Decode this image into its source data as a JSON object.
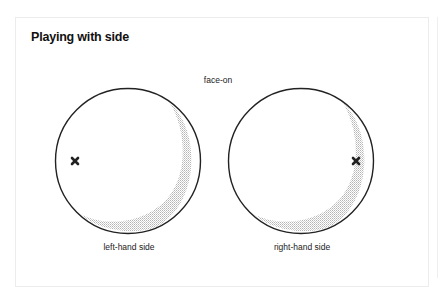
{
  "title": "Playing with side",
  "diagram": {
    "top_label": "face-on",
    "panels": [
      {
        "label": "left-hand side",
        "marker_position": "left"
      },
      {
        "label": "right-hand side",
        "marker_position": "right"
      }
    ],
    "colors": {
      "outline": "#222222",
      "shading": "#bdbdbd",
      "marker": "#222222"
    }
  }
}
